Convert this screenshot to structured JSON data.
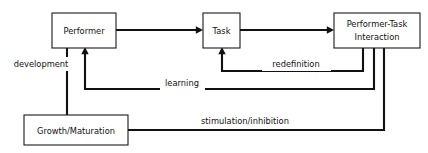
{
  "diagram": {
    "type": "flow-diagram",
    "colors": {
      "background": "#ffffff",
      "box_fill": "#ffffff",
      "box_stroke": "#1a1a1a",
      "connector": "#111111",
      "text": "#111111"
    },
    "nodes": [
      {
        "id": "performer",
        "label": "Performer",
        "lines": [
          "Performer"
        ],
        "x": 52,
        "y": 13,
        "width": 64,
        "height": 35
      },
      {
        "id": "task",
        "label": "Task",
        "lines": [
          "Task"
        ],
        "x": 203,
        "y": 13,
        "width": 37,
        "height": 35
      },
      {
        "id": "performer_task_interaction",
        "label": "Performer-Task Interaction",
        "lines": [
          "Performer-Task",
          "Interaction"
        ],
        "x": 334,
        "y": 13,
        "width": 86,
        "height": 35
      },
      {
        "id": "growth_maturation",
        "label": "Growth/Maturation",
        "lines": [
          "Growth/Maturation"
        ],
        "x": 24,
        "y": 115,
        "width": 104,
        "height": 30
      }
    ],
    "edges": [
      {
        "id": "performer-to-task",
        "label": "",
        "from": "performer",
        "to": "task",
        "arrow": true
      },
      {
        "id": "task-to-interaction",
        "label": "",
        "from": "task",
        "to": "performer_task_interaction",
        "arrow": true
      },
      {
        "id": "redefinition",
        "label": "redefinition",
        "from": "performer_task_interaction",
        "to": "task",
        "arrow": true,
        "label_x": 296,
        "label_y": 64
      },
      {
        "id": "learning",
        "label": "learning",
        "from": "performer_task_interaction",
        "to": "performer",
        "arrow": true,
        "label_x": 182,
        "label_y": 83
      },
      {
        "id": "stimulation-inhibition",
        "label": "stimulation/inhibition",
        "from": "growth_maturation",
        "to": "performer_task_interaction",
        "arrow": false,
        "label_x": 245,
        "label_y": 121
      },
      {
        "id": "development",
        "label": "development",
        "from": "growth_maturation",
        "to": "performer",
        "arrow": false,
        "label_x": 41,
        "label_y": 64
      }
    ]
  }
}
